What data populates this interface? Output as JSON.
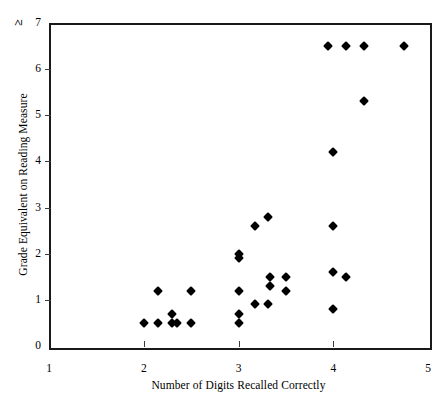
{
  "chart_data": {
    "type": "scatter",
    "title": "",
    "xlabel": "Number of Digits Recalled Correctly",
    "ylabel": "Grade Equivalent on Reading Measure",
    "xlim": [
      1,
      5
    ],
    "ylim": [
      0,
      7
    ],
    "xticks": [
      "1",
      "2",
      "3",
      "4",
      "5"
    ],
    "xtick_values": [
      1,
      2,
      3,
      4,
      5
    ],
    "yticks": [
      "0",
      "1",
      "2",
      "3",
      "4",
      "5",
      "6",
      "7"
    ],
    "ytick_values": [
      0,
      1,
      2,
      3,
      4,
      5,
      6,
      7
    ],
    "ytop_prefix": "≥",
    "grid": false,
    "legend": null,
    "marker": "filled-diamond",
    "marker_color": "#000000",
    "points": [
      {
        "x": 2.0,
        "y": 0.5
      },
      {
        "x": 2.15,
        "y": 0.5
      },
      {
        "x": 2.3,
        "y": 0.5
      },
      {
        "x": 2.35,
        "y": 0.5
      },
      {
        "x": 2.5,
        "y": 0.5
      },
      {
        "x": 2.3,
        "y": 0.7
      },
      {
        "x": 2.15,
        "y": 1.2
      },
      {
        "x": 2.5,
        "y": 1.2
      },
      {
        "x": 3.0,
        "y": 0.5
      },
      {
        "x": 3.0,
        "y": 0.7
      },
      {
        "x": 3.0,
        "y": 1.2
      },
      {
        "x": 3.0,
        "y": 1.9
      },
      {
        "x": 3.0,
        "y": 2.0
      },
      {
        "x": 3.17,
        "y": 0.9
      },
      {
        "x": 3.17,
        "y": 2.6
      },
      {
        "x": 3.31,
        "y": 0.9
      },
      {
        "x": 3.33,
        "y": 1.3
      },
      {
        "x": 3.33,
        "y": 1.5
      },
      {
        "x": 3.31,
        "y": 2.8
      },
      {
        "x": 3.5,
        "y": 1.2
      },
      {
        "x": 3.5,
        "y": 1.5
      },
      {
        "x": 4.0,
        "y": 0.8
      },
      {
        "x": 4.0,
        "y": 1.6
      },
      {
        "x": 4.0,
        "y": 2.6
      },
      {
        "x": 4.0,
        "y": 4.2
      },
      {
        "x": 4.13,
        "y": 1.5
      },
      {
        "x": 4.32,
        "y": 5.3
      },
      {
        "x": 3.94,
        "y": 6.5
      },
      {
        "x": 4.13,
        "y": 6.5
      },
      {
        "x": 4.32,
        "y": 6.5
      },
      {
        "x": 4.75,
        "y": 6.5
      }
    ]
  }
}
